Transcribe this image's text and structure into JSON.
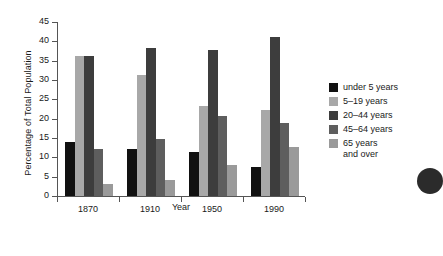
{
  "chart_data": {
    "type": "bar",
    "title": "",
    "xlabel": "Year",
    "ylabel": "Percentage of Total Population",
    "categories": [
      "1870",
      "1910",
      "1950",
      "1990"
    ],
    "ylim": [
      0,
      45
    ],
    "yticks": [
      0,
      5,
      10,
      15,
      20,
      25,
      30,
      35,
      40,
      45
    ],
    "grid": false,
    "legend_position": "right",
    "series": [
      {
        "name": "under 5 years",
        "color": "#111111",
        "values": [
          14.0,
          12.2,
          11.4,
          7.6
        ]
      },
      {
        "name": "5–19 years",
        "color": "#a8a8a8",
        "values": [
          36.2,
          31.4,
          23.2,
          22.3
        ]
      },
      {
        "name": "20–44 years",
        "color": "#3d3d3d",
        "values": [
          36.2,
          38.4,
          37.8,
          41.0
        ]
      },
      {
        "name": "45–64 years",
        "color": "#5e5e5e",
        "values": [
          12.2,
          14.7,
          20.8,
          18.8
        ]
      },
      {
        "name": "65 years\nand over",
        "color": "#9a9a9a",
        "values": [
          3.0,
          4.1,
          8.1,
          12.6
        ]
      }
    ]
  },
  "legend": {
    "items": [
      {
        "label": "under 5 years"
      },
      {
        "label": "5–19 years"
      },
      {
        "label": "20–44 years"
      },
      {
        "label": "45–64 years"
      },
      {
        "label": "65 years\nand over"
      }
    ]
  }
}
